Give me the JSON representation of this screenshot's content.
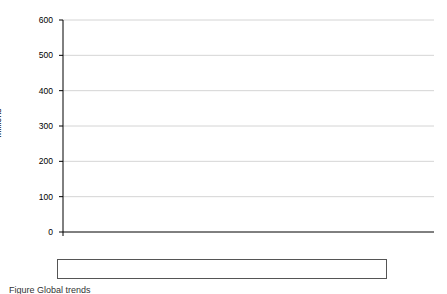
{
  "figure": {
    "caption": "Figure  Global trends"
  },
  "chart_data": {
    "type": "line",
    "title": "",
    "xlabel": "",
    "ylabel": "Millions",
    "x": [
      1950,
      1955,
      1960,
      1965,
      1970,
      1975,
      1980,
      1985,
      1990,
      1995,
      2000,
      2005,
      2010
    ],
    "xlim": [
      1950,
      2010
    ],
    "ylim": [
      0,
      600
    ],
    "y_ticks": [
      0,
      100,
      200,
      300,
      400,
      500,
      600
    ],
    "x_ticks": [
      1950,
      1955,
      1960,
      1965,
      1970,
      1975,
      1980,
      1985,
      1990,
      1995,
      2000,
      2005,
      2010
    ],
    "grid": "horizontal",
    "legend_position": "bottom",
    "series": [
      {
        "name": "More developed regions",
        "style": "dashed",
        "color": "#000000",
        "values": [
          118,
          128,
          140,
          152,
          164,
          178,
          189,
          190,
          190,
          158,
          157,
          152,
          143
        ]
      },
      {
        "name": "Less developed regions",
        "style": "solid",
        "color": "#000000",
        "values": [
          62,
          73,
          89,
          110,
          136,
          170,
          208,
          250,
          300,
          378,
          450,
          495,
          540
        ]
      }
    ]
  },
  "axes": {
    "y_tick_labels": [
      "600",
      "500",
      "400",
      "300",
      "200",
      "100",
      "0"
    ],
    "x_tick_labels": [
      "1950",
      "1955",
      "1960",
      "1965",
      "1970",
      "1975",
      "1980",
      "1985",
      "1990",
      "1995",
      "2000",
      "2005",
      "2010"
    ],
    "y_axis_title": "Millions"
  },
  "legend": {
    "entries": [
      {
        "label": "More developed regions",
        "style": "dashed"
      },
      {
        "label": "Less developed regions",
        "style": "solid"
      }
    ]
  }
}
